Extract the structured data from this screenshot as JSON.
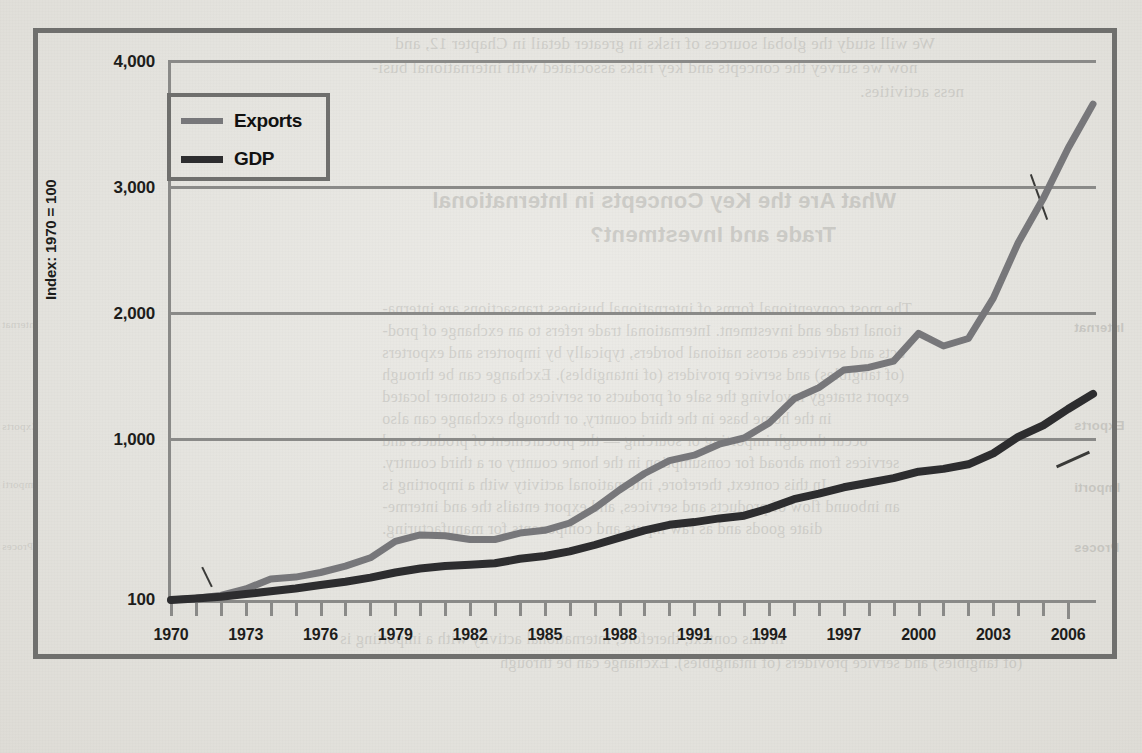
{
  "figure": {
    "legend": [
      {
        "label": "Exports",
        "color": "#77777a",
        "icon": "line-swatch-exports"
      },
      {
        "label": "GDP",
        "color": "#2d2d2f",
        "icon": "line-swatch-gdp"
      }
    ],
    "y_axis_title": "Index: 1970 = 100",
    "y_ticks": [
      "4,000",
      "3,000",
      "2,000",
      "1,000",
      "100"
    ],
    "x_ticks": [
      "1970",
      "1973",
      "1976",
      "1979",
      "1982",
      "1985",
      "1988",
      "1991",
      "1994",
      "1997",
      "2000",
      "2003",
      "2006"
    ]
  },
  "chart_data": {
    "type": "line",
    "title": "",
    "xlabel": "",
    "ylabel": "Index: 1970 = 100",
    "xlim": [
      1970,
      2007
    ],
    "ylim": [
      100,
      4000
    ],
    "grid": true,
    "legend_position": "top-left-inside",
    "x": [
      1970,
      1971,
      1972,
      1973,
      1974,
      1975,
      1976,
      1977,
      1978,
      1979,
      1980,
      1981,
      1982,
      1983,
      1984,
      1985,
      1986,
      1987,
      1988,
      1989,
      1990,
      1991,
      1992,
      1993,
      1994,
      1995,
      1996,
      1997,
      1998,
      1999,
      2000,
      2001,
      2002,
      2003,
      2004,
      2005,
      2006,
      2007
    ],
    "series": [
      {
        "name": "Exports",
        "color": "#77777a",
        "values": [
          100,
          110,
          125,
          160,
          215,
          225,
          250,
          285,
          330,
          420,
          455,
          450,
          430,
          430,
          465,
          480,
          520,
          600,
          700,
          790,
          860,
          890,
          950,
          1000,
          1120,
          1310,
          1400,
          1540,
          1560,
          1610,
          1830,
          1730,
          1790,
          2110,
          2550,
          2900,
          3300,
          3650
        ]
      },
      {
        "name": "GDP",
        "color": "#2d2d2f",
        "values": [
          100,
          108,
          118,
          132,
          148,
          163,
          182,
          200,
          222,
          250,
          272,
          285,
          292,
          300,
          325,
          340,
          365,
          400,
          440,
          480,
          510,
          525,
          545,
          560,
          600,
          650,
          680,
          715,
          740,
          765,
          800,
          815,
          840,
          900,
          990,
          1100,
          1230,
          1350
        ]
      }
    ]
  },
  "background_page": {
    "paragraph_top": [
      "We will study the global sources of risks in greater detail in Chapter 12, and",
      "now we survey the concepts and key risks associated with international busi-",
      "ness activities."
    ],
    "section_heading": [
      "What Are the Key Concepts in International",
      "Trade and Investment?"
    ],
    "paragraph_body": [
      "The most conventional forms of international business transactions are interna-",
      "tional trade and investment. International trade refers to an exchange of prod-",
      "ucts and services across national borders, typically by importers and exporters",
      "(of tangibles) and service providers (of intangibles). Exchange can be through",
      "export strategy involving the sale of products or services to a customer located",
      "in the home base in the third country, or through exchange can also",
      "occur through importing or sourcing — the procurement of products and",
      "services from abroad for consumption in the home country or a third country.",
      "In this context, therefore, international activity with a importing is",
      "an inbound flow of products and services, and export entails the and interme-",
      "diate goods and as raw inputs and components for manufacturing."
    ],
    "margin_notes": [
      "Internat",
      "Exports",
      "Importi",
      "Proces"
    ]
  }
}
